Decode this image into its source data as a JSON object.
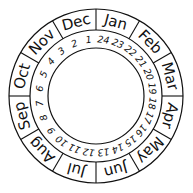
{
  "dial": {
    "center": [
      96,
      96
    ],
    "outer_radius": 87,
    "middle_radius": 66,
    "inner_radius": 48,
    "stroke_color": "#111111",
    "background_color": "#ffffff",
    "months": [
      "Jan",
      "Feb",
      "Mar",
      "Apr",
      "May",
      "Jun",
      "Jul",
      "Aug",
      "Sep",
      "Oct",
      "Nov",
      "Dec"
    ],
    "numbers": [
      "24",
      "23",
      "22",
      "21",
      "20",
      "19",
      "18",
      "17",
      "16",
      "15",
      "14",
      "13",
      "12",
      "11",
      "10",
      "9",
      "8",
      "7",
      "6",
      "5",
      "4",
      "3",
      "2",
      "1"
    ]
  }
}
